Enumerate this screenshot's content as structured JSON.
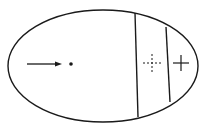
{
  "diagram": {
    "type": "ellipse-regions",
    "stroke_color": "#1a1a1a",
    "background": "#ffffff",
    "ellipse": {
      "cx": 103,
      "cy": 66,
      "rx": 95,
      "ry": 56
    },
    "dividers": [
      {
        "x1": 135,
        "y1": 13,
        "x2": 138,
        "y2": 117
      },
      {
        "x1": 166,
        "y1": 27,
        "x2": 170,
        "y2": 102
      }
    ],
    "arrow": {
      "x1": 27,
      "y1": 64,
      "x2": 62,
      "y2": 64
    },
    "dot": {
      "cx": 71,
      "cy": 64,
      "r": 1.8
    },
    "dashed_cross": {
      "cx": 152,
      "cy": 63,
      "half": 9
    },
    "solid_cross": {
      "cx": 181,
      "cy": 63,
      "half": 8
    },
    "labels": []
  }
}
